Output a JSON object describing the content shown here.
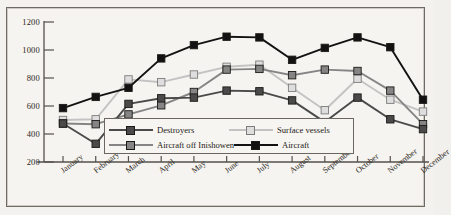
{
  "chart_data": {
    "type": "line",
    "title": "",
    "xlabel": "",
    "ylabel": "",
    "ylim": [
      200,
      1200
    ],
    "ytick_step": 200,
    "yticks": [
      200,
      400,
      600,
      800,
      1000,
      1200
    ],
    "grid": false,
    "legend_position": "inside-bottom-center",
    "categories": [
      "January",
      "February",
      "March",
      "April",
      "May",
      "June",
      "July",
      "August",
      "September",
      "October",
      "November",
      "December"
    ],
    "series": [
      {
        "name": "Destroyers",
        "color": "#4a4a4a",
        "marker": "square-filled",
        "values": [
          475,
          330,
          615,
          655,
          660,
          710,
          705,
          640,
          485,
          660,
          505,
          435
        ]
      },
      {
        "name": "Surface vessels",
        "color": "#c3c3c3",
        "marker": "square-open",
        "values": [
          500,
          505,
          790,
          770,
          825,
          880,
          895,
          730,
          570,
          795,
          645,
          560
        ]
      },
      {
        "name": "Aircraft off Inishowen",
        "color": "#858585",
        "marker": "square-filled",
        "values": [
          475,
          470,
          540,
          605,
          700,
          860,
          865,
          820,
          860,
          850,
          710,
          470
        ]
      },
      {
        "name": "Aircraft",
        "color": "#121212",
        "marker": "square-filled",
        "values": [
          585,
          665,
          730,
          940,
          1035,
          1095,
          1090,
          930,
          1015,
          1090,
          1020,
          645
        ]
      }
    ]
  },
  "legend": {
    "entries": [
      {
        "label": "Destroyers"
      },
      {
        "label": "Surface vessels"
      },
      {
        "label": "Aircraft off Inishowen"
      },
      {
        "label": "Aircraft"
      }
    ]
  }
}
